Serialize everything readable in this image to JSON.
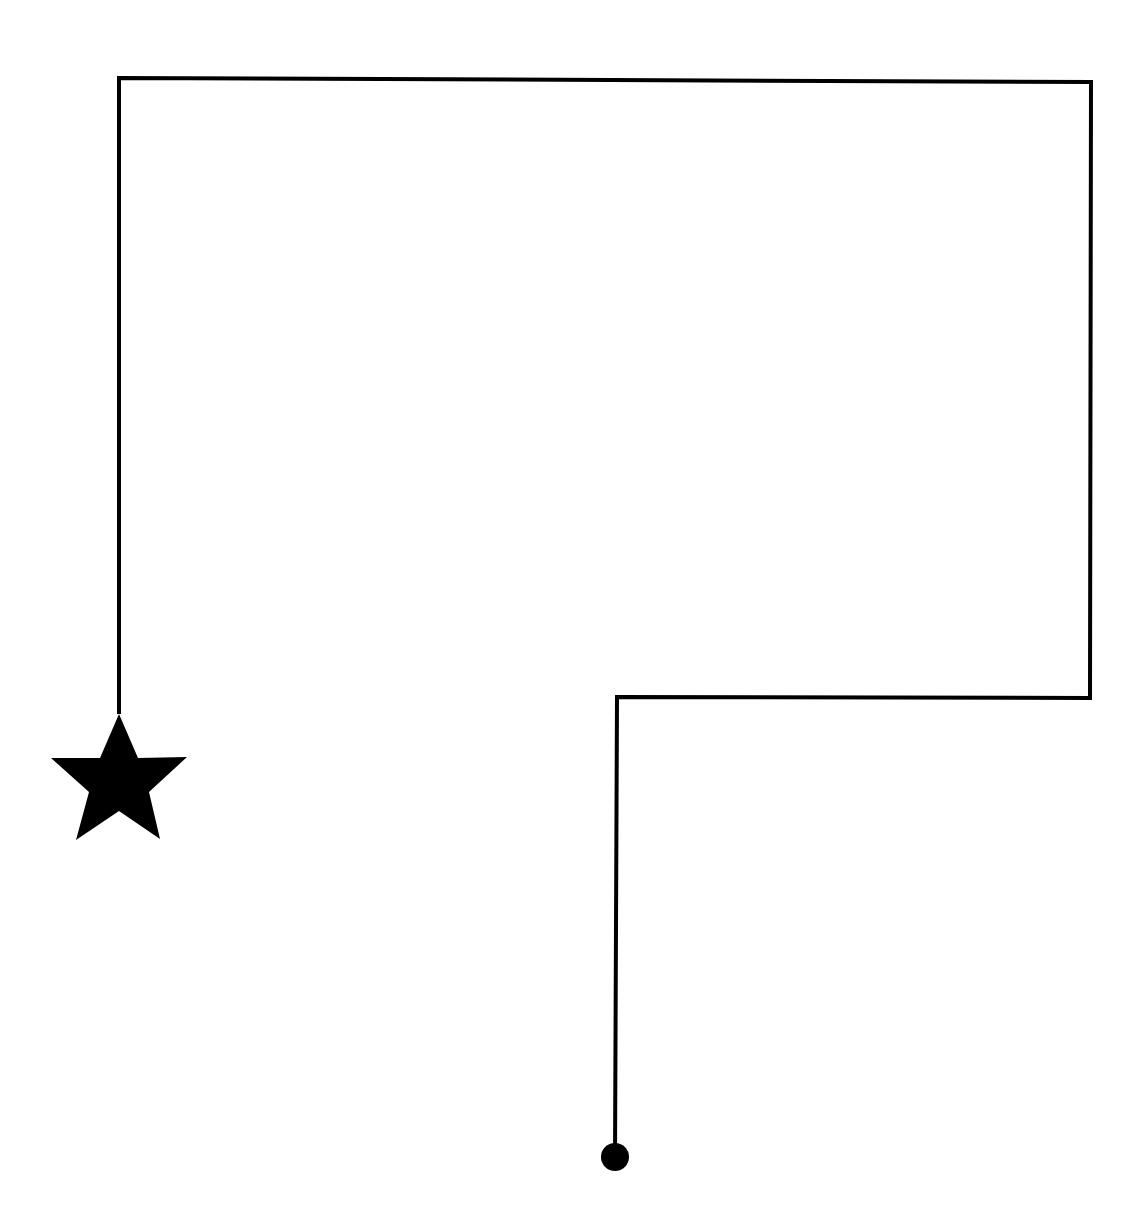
{
  "diagram": {
    "type": "path",
    "description": "Route from a start dot to an end star",
    "colors": {
      "background": "#ffffff",
      "stroke": "#000000",
      "marker_fill": "#000000"
    },
    "stroke_width": 4,
    "path_points": [
      [
        615,
        1157
      ],
      [
        617,
        697
      ],
      [
        1090,
        698
      ],
      [
        1091,
        82
      ],
      [
        119,
        78
      ],
      [
        119,
        714
      ]
    ],
    "start_marker": {
      "shape": "circle",
      "label": "start-dot",
      "cx": 615,
      "cy": 1157,
      "r": 14
    },
    "end_marker": {
      "shape": "star",
      "label": "end-star",
      "points": "119,714 138,758 187,757 149,792 160,839 119,811 76,840 89,792 51,758 100,758"
    }
  }
}
